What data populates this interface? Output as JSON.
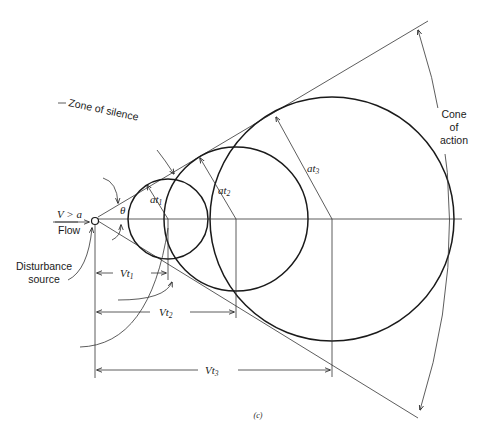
{
  "figure": {
    "caption": "(c)",
    "labels": {
      "zone_of_silence": "Zone of silence",
      "cone_of_action": [
        "Cone",
        "of",
        "action"
      ],
      "flow_condition": "V > a",
      "flow": "Flow",
      "theta": "θ",
      "disturbance_source": [
        "Disturbance",
        "source"
      ],
      "radius_labels": [
        {
          "main": "at",
          "sub": "1"
        },
        {
          "main": "at",
          "sub": "2"
        },
        {
          "main": "at",
          "sub": "3"
        }
      ],
      "distance_labels": [
        {
          "main": "Vt",
          "sub": "1"
        },
        {
          "main": "Vt",
          "sub": "2"
        },
        {
          "main": "Vt",
          "sub": "3"
        }
      ]
    },
    "geometry": {
      "source": {
        "x": 95,
        "y": 219
      },
      "circles": [
        {
          "cx": 168,
          "cy": 219,
          "r": 40
        },
        {
          "cx": 236,
          "cy": 219,
          "r": 72
        },
        {
          "cx": 332,
          "cy": 219,
          "r": 122
        }
      ],
      "mach_angle_deg": 31
    }
  }
}
